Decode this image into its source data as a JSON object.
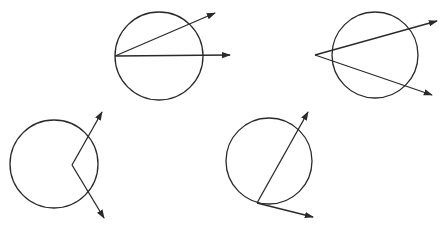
{
  "diagram": {
    "stroke_color": "#2a2a2a",
    "intersection_color": "#9a9a9a",
    "background": "#ffffff",
    "figures": [
      {
        "id": "fig-vertex-on-circle-two-secants",
        "circle": {
          "cx": 159,
          "cy": 56,
          "r": 44
        },
        "vertex": {
          "x": 115,
          "y": 56
        },
        "rays": [
          {
            "x2": 215,
            "y2": 13
          },
          {
            "x2": 230,
            "y2": 55
          }
        ]
      },
      {
        "id": "fig-vertex-outside-circle",
        "circle": {
          "cx": 375,
          "cy": 55,
          "r": 43
        },
        "vertex": {
          "x": 315,
          "y": 55
        },
        "rays": [
          {
            "x2": 437,
            "y2": 21
          },
          {
            "x2": 432,
            "y2": 95
          }
        ]
      },
      {
        "id": "fig-vertex-inside-circle",
        "circle": {
          "cx": 54,
          "cy": 164,
          "r": 44
        },
        "vertex": {
          "x": 72,
          "y": 165
        },
        "rays": [
          {
            "x2": 102,
            "y2": 112
          },
          {
            "x2": 104,
            "y2": 218
          }
        ]
      },
      {
        "id": "fig-vertex-on-circle-tangent-chord",
        "circle": {
          "cx": 269,
          "cy": 161,
          "r": 43
        },
        "vertex": {
          "x": 257,
          "y": 203
        },
        "rays": [
          {
            "x2": 308,
            "y2": 112
          },
          {
            "x2": 313,
            "y2": 217
          }
        ]
      }
    ]
  }
}
